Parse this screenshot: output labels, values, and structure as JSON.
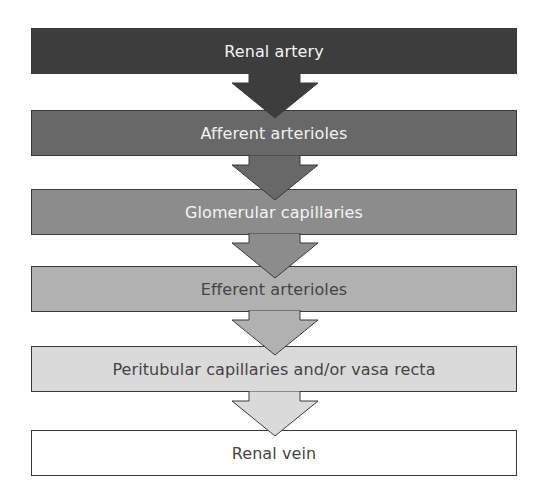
{
  "diagram": {
    "type": "vertical-flowchart",
    "title": "",
    "steps": [
      {
        "label": "Renal artery",
        "fill": "#3d3d3d",
        "text_color": "#f2f2f2",
        "top": 28
      },
      {
        "label": "Afferent arterioles",
        "fill": "#686868",
        "text_color": "#f2f2f2",
        "top": 110
      },
      {
        "label": "Glomerular capillaries",
        "fill": "#8c8c8c",
        "text_color": "#f4f4f4",
        "top": 189
      },
      {
        "label": "Efferent arterioles",
        "fill": "#b1b1b1",
        "text_color": "#444444",
        "top": 266
      },
      {
        "label": "Peritubular capillaries and/or vasa recta",
        "fill": "#dadada",
        "text_color": "#444444",
        "top": 346
      },
      {
        "label": "Renal vein",
        "fill": "#ffffff",
        "text_color": "#444444",
        "top": 430
      }
    ],
    "arrows": [
      {
        "from": "Renal artery",
        "to": "Afferent arterioles",
        "fill": "#3d3d3d",
        "top": 73
      },
      {
        "from": "Afferent arterioles",
        "to": "Glomerular capillaries",
        "fill": "#686868",
        "top": 155
      },
      {
        "from": "Glomerular capillaries",
        "to": "Efferent arterioles",
        "fill": "#8c8c8c",
        "top": 233
      },
      {
        "from": "Efferent arterioles",
        "to": "Peritubular capillaries and/or vasa recta",
        "fill": "#b1b1b1",
        "top": 310
      },
      {
        "from": "Peritubular capillaries and/or vasa recta",
        "to": "Renal vein",
        "fill": "#dadada",
        "top": 391
      }
    ],
    "border_color": "#3a3a3a",
    "icons": {
      "arrow": "down-block-arrow-icon"
    }
  }
}
